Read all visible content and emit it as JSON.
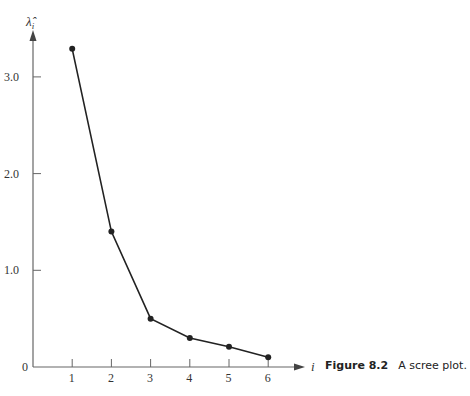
{
  "chart_data": {
    "type": "line",
    "title": "",
    "xlabel": "i",
    "ylabel": "λ̂_i",
    "x": [
      1,
      2,
      3,
      4,
      5,
      6
    ],
    "series": [
      {
        "name": "eigenvalues",
        "values": [
          3.29,
          1.4,
          0.5,
          0.3,
          0.21,
          0.1
        ]
      }
    ],
    "x_ticks": [
      "1",
      "2",
      "3",
      "4",
      "5",
      "6"
    ],
    "y_ticks": [
      "0",
      "1.0",
      "2.0",
      "3.0"
    ],
    "ylim": [
      0,
      3.5
    ],
    "xlim": [
      0,
      7
    ],
    "grid": false,
    "legend": null,
    "markers": true,
    "line_color": "#222222"
  },
  "caption": {
    "figure_label": "Figure 8.2",
    "text": "A scree plot."
  },
  "axes": {
    "y_label_main": "λ̂",
    "y_label_sub": "i",
    "x_label": "i"
  }
}
